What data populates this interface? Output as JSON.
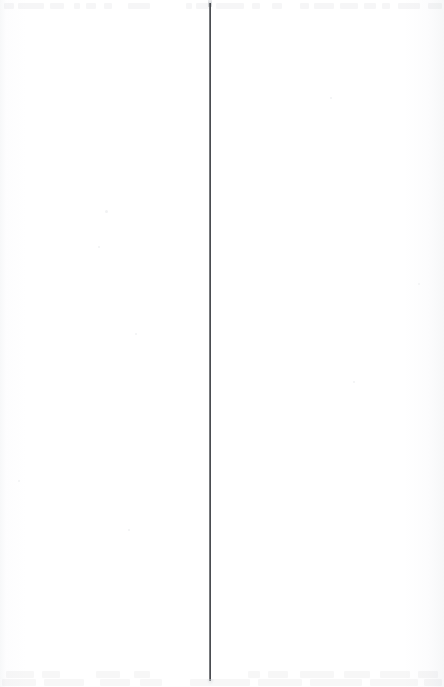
{
  "window": {
    "title": "",
    "background_color": "#ffffff",
    "width_px": 444,
    "height_px": 687,
    "content_text": ""
  },
  "divider": {
    "name": "vertical-divider",
    "orientation": "vertical",
    "x_px": 209,
    "top_px": 3,
    "bottom_px": 681,
    "thickness_px": 2,
    "color": "#3a3c40",
    "edge_color": "#96999e",
    "label": ""
  },
  "panes": {
    "left": {
      "name": "left-pane",
      "x_px": 0,
      "width_px": 209,
      "content_text": "",
      "background_color": "#ffffff"
    },
    "right": {
      "name": "right-pane",
      "x_px": 211,
      "width_px": 233,
      "content_text": "",
      "background_color": "#ffffff"
    }
  },
  "ghost_toolbar": {
    "name": "top-toolbar-ghost",
    "height_px": 13,
    "color": "#6d7278",
    "opacity": 0.055,
    "segments": [
      {
        "x_px": 4,
        "width_px": 10
      },
      {
        "x_px": 18,
        "width_px": 26
      },
      {
        "x_px": 50,
        "width_px": 14
      },
      {
        "x_px": 74,
        "width_px": 6
      },
      {
        "x_px": 86,
        "width_px": 10
      },
      {
        "x_px": 104,
        "width_px": 8
      },
      {
        "x_px": 128,
        "width_px": 22
      },
      {
        "x_px": 186,
        "width_px": 6
      },
      {
        "x_px": 196,
        "width_px": 14
      },
      {
        "x_px": 216,
        "width_px": 28
      },
      {
        "x_px": 252,
        "width_px": 8
      },
      {
        "x_px": 272,
        "width_px": 10
      },
      {
        "x_px": 300,
        "width_px": 9
      },
      {
        "x_px": 314,
        "width_px": 20
      },
      {
        "x_px": 340,
        "width_px": 18
      },
      {
        "x_px": 364,
        "width_px": 12
      },
      {
        "x_px": 382,
        "width_px": 8
      },
      {
        "x_px": 398,
        "width_px": 22
      },
      {
        "x_px": 428,
        "width_px": 14
      }
    ]
  },
  "ghost_statusbar": {
    "name": "bottom-status-ghost",
    "height_px": 19,
    "color": "#70757b",
    "opacity": 0.05,
    "segments_upper": [
      {
        "x_px": 6,
        "width_px": 28
      },
      {
        "x_px": 42,
        "width_px": 18
      },
      {
        "x_px": 96,
        "width_px": 24
      },
      {
        "x_px": 134,
        "width_px": 16
      },
      {
        "x_px": 248,
        "width_px": 12
      },
      {
        "x_px": 268,
        "width_px": 20
      },
      {
        "x_px": 300,
        "width_px": 34
      },
      {
        "x_px": 344,
        "width_px": 26
      },
      {
        "x_px": 380,
        "width_px": 30
      },
      {
        "x_px": 418,
        "width_px": 20
      }
    ],
    "segments_lower": [
      {
        "x_px": 2,
        "width_px": 34
      },
      {
        "x_px": 44,
        "width_px": 40
      },
      {
        "x_px": 100,
        "width_px": 30
      },
      {
        "x_px": 140,
        "width_px": 22
      },
      {
        "x_px": 190,
        "width_px": 60
      },
      {
        "x_px": 258,
        "width_px": 44
      },
      {
        "x_px": 310,
        "width_px": 52
      },
      {
        "x_px": 370,
        "width_px": 48
      },
      {
        "x_px": 424,
        "width_px": 18
      }
    ]
  },
  "specks": [
    {
      "x_px": 105,
      "y_px": 210,
      "size_px": 3
    },
    {
      "x_px": 98,
      "y_px": 246,
      "size_px": 2
    },
    {
      "x_px": 135,
      "y_px": 333,
      "size_px": 2
    },
    {
      "x_px": 330,
      "y_px": 97,
      "size_px": 2
    },
    {
      "x_px": 128,
      "y_px": 529,
      "size_px": 2
    },
    {
      "x_px": 353,
      "y_px": 381,
      "size_px": 2
    },
    {
      "x_px": 18,
      "y_px": 480,
      "size_px": 2
    },
    {
      "x_px": 418,
      "y_px": 283,
      "size_px": 2
    }
  ]
}
